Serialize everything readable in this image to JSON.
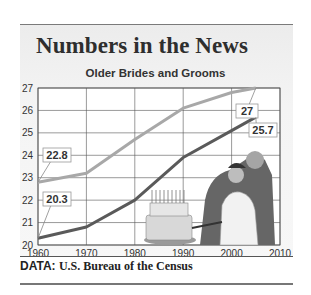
{
  "header": {
    "title": "Numbers in the News"
  },
  "footer": {
    "lead": "DATA:",
    "source": "U.S. Bureau of the Census"
  },
  "chart_data": {
    "type": "line",
    "title": "Older Brides and Grooms",
    "xlabel": "",
    "ylabel": "",
    "x": [
      1960,
      1970,
      1980,
      1990,
      2000,
      2005
    ],
    "series": [
      {
        "name": "Grooms (median age at first marriage)",
        "color": "#a8a8a8",
        "values": [
          22.8,
          23.2,
          24.7,
          26.1,
          26.8,
          27.0
        ]
      },
      {
        "name": "Brides (median age at first marriage)",
        "color": "#5a5a5a",
        "values": [
          20.3,
          20.8,
          22.0,
          23.9,
          25.1,
          25.7
        ]
      }
    ],
    "annotations": [
      {
        "label": "22.8",
        "series": 0,
        "x": 1960
      },
      {
        "label": "20.3",
        "series": 1,
        "x": 1960
      },
      {
        "label": "27",
        "series": 0,
        "x": 2005
      },
      {
        "label": "25.7",
        "series": 1,
        "x": 2005
      }
    ],
    "xticks": [
      "1960",
      "1970",
      "1980",
      "1990",
      "2000",
      "2010"
    ],
    "yticks": [
      "20",
      "21",
      "22",
      "23",
      "24",
      "25",
      "26",
      "27"
    ],
    "xlim": [
      1960,
      2010
    ],
    "ylim": [
      20,
      27
    ],
    "grid": true,
    "legend": "none",
    "illustration": "wedding couple cutting cake"
  }
}
